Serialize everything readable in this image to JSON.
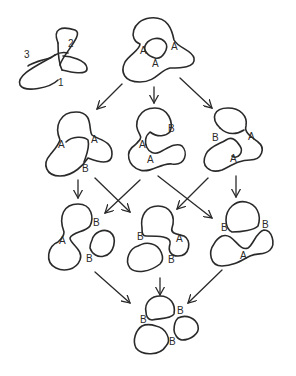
{
  "trefoil": {
    "crossing_labels": [
      "1",
      "2",
      "3"
    ]
  },
  "states": {
    "top": {
      "labels": [
        "A",
        "A",
        "A"
      ]
    },
    "row2_left": {
      "labels": [
        "A",
        "A",
        "B"
      ]
    },
    "row2_mid": {
      "labels": [
        "B",
        "A",
        "A"
      ]
    },
    "row2_right": {
      "labels": [
        "B",
        "A",
        "A"
      ]
    },
    "row3_left": {
      "labels": [
        "B",
        "A",
        "B"
      ]
    },
    "row3_mid": {
      "labels": [
        "B",
        "A",
        "B"
      ]
    },
    "row3_right": {
      "labels": [
        "B",
        "B",
        "A"
      ]
    },
    "bottom": {
      "labels": [
        "B",
        "B",
        "B"
      ]
    }
  },
  "colors": {
    "stroke": "#2a2a2a",
    "background": "#ffffff"
  }
}
